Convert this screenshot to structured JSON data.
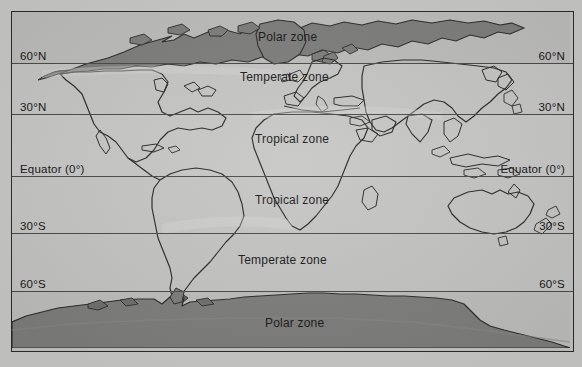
{
  "figure": {
    "kind": "world-climate-zone-map",
    "projection": "cylindrical-equirectangular",
    "page_background": "#cacac8",
    "map_background": "#c3c3c1",
    "frame_color": "#2a2a2a"
  },
  "latitudes": [
    {
      "id": "lat-60n",
      "label": "60°N",
      "value": 60,
      "hemisphere": "N",
      "y": 51
    },
    {
      "id": "lat-30n",
      "label": "30°N",
      "value": 30,
      "hemisphere": "N",
      "y": 102
    },
    {
      "id": "lat-eq",
      "label": "Equator (0°)",
      "value": 0,
      "hemisphere": "",
      "y": 164
    },
    {
      "id": "lat-30s",
      "label": "30°S",
      "value": -30,
      "hemisphere": "S",
      "y": 221
    },
    {
      "id": "lat-60s",
      "label": "60°S",
      "value": -60,
      "hemisphere": "S",
      "y": 279
    }
  ],
  "lat_label_text": {
    "n60": "60°N",
    "n30": "30°N",
    "eq": "Equator (0°)",
    "s30": "30°S",
    "s60": "60°S"
  },
  "zones": [
    {
      "id": "zone-polar-north",
      "label": "Polar zone",
      "x": 246,
      "y": 18,
      "band": "north-polar"
    },
    {
      "id": "zone-temperate-north",
      "label": "Temperate zone",
      "x": 228,
      "y": 58,
      "band": "north-temperate"
    },
    {
      "id": "zone-tropical-north",
      "label": "Tropical zone",
      "x": 243,
      "y": 120,
      "band": "north-tropical"
    },
    {
      "id": "zone-tropical-south",
      "label": "Tropical zone",
      "x": 243,
      "y": 181,
      "band": "south-tropical"
    },
    {
      "id": "zone-temperate-south",
      "label": "Temperate zone",
      "x": 226,
      "y": 241,
      "band": "south-temperate"
    },
    {
      "id": "zone-polar-south",
      "label": "Polar zone",
      "x": 253,
      "y": 304,
      "band": "south-polar"
    }
  ],
  "zone_label_text": {
    "polar_north": "Polar zone",
    "temperate_north": "Temperate zone",
    "tropical_north": "Tropical zone",
    "tropical_south": "Tropical zone",
    "temperate_south": "Temperate zone",
    "polar_south": "Polar zone"
  },
  "landmasses": {
    "polar_fill": "#7d7d7b",
    "polar_stroke": "#2d2d2d",
    "continent_fill": "none",
    "continent_stroke": "#2b2b2b",
    "named": [
      "Arctic / northern boreal belt",
      "Greenland",
      "North America",
      "South America",
      "Africa",
      "Europe",
      "Asia",
      "Australia",
      "New Zealand",
      "Madagascar",
      "Antarctica"
    ]
  }
}
